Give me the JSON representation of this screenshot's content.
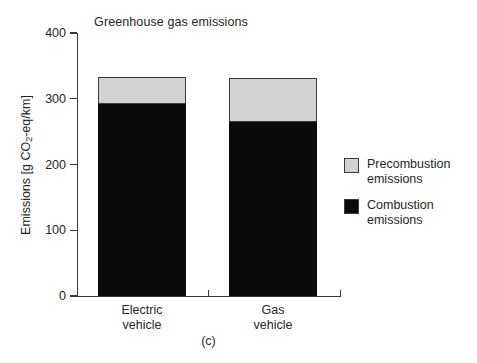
{
  "chart_data": {
    "type": "bar",
    "subtype": "stacked-bar",
    "title": "Greenhouse gas emissions",
    "xlabel": "",
    "ylabel": "Emissions [g CO2-eq/km]",
    "ylabel_display": "Emissions [g CO",
    "ylabel_sub": "2",
    "ylabel_tail": "-eq/km]",
    "categories": [
      "Electric vehicle",
      "Gas vehicle"
    ],
    "category_lines": [
      [
        "Electric",
        "vehicle"
      ],
      [
        "Gas",
        "vehicle"
      ]
    ],
    "series": [
      {
        "name": "Combustion emissions",
        "values": [
          292,
          265
        ],
        "color": "#0a0a0a"
      },
      {
        "name": "Precombustion emissions",
        "values": [
          41,
          67
        ],
        "color": "#d2d2d2"
      }
    ],
    "totals": [
      333,
      332
    ],
    "ylim": [
      0,
      400
    ],
    "yticks": [
      400,
      300,
      200,
      100,
      0
    ],
    "ytick_labels": [
      "400",
      "300",
      "200",
      "100",
      "0"
    ],
    "grid": false,
    "legend_position": "right",
    "caption": "(c)"
  },
  "legend": {
    "items": [
      {
        "label": "Precombustion\nemissions",
        "color": "#d2d2d2"
      },
      {
        "label": "Combustion\nemissions",
        "color": "#0a0a0a"
      }
    ]
  }
}
